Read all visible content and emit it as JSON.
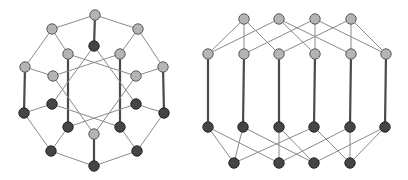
{
  "diagram": {
    "node_radius": 5.2,
    "colors": {
      "light": "#b4b4b4",
      "dark": "#454545",
      "thin_edge": "#8a8a8a",
      "thick_edge": "#4a4a4a"
    },
    "graphs": [
      {
        "name": "left-graph",
        "layout": "circular",
        "nodes": [
          {
            "id": "o_top",
            "x": 95,
            "y": 15,
            "shade": "light"
          },
          {
            "id": "o_ur",
            "x": 138,
            "y": 29,
            "shade": "light"
          },
          {
            "id": "o_r",
            "x": 163,
            "y": 67,
            "shade": "light"
          },
          {
            "id": "o_rd",
            "x": 164,
            "y": 113,
            "shade": "dark"
          },
          {
            "id": "o_lrd",
            "x": 137,
            "y": 151,
            "shade": "dark"
          },
          {
            "id": "o_bot",
            "x": 94,
            "y": 166,
            "shade": "dark"
          },
          {
            "id": "o_lld",
            "x": 51,
            "y": 151,
            "shade": "dark"
          },
          {
            "id": "o_ld",
            "x": 24,
            "y": 113,
            "shade": "dark"
          },
          {
            "id": "o_l",
            "x": 25,
            "y": 67,
            "shade": "light"
          },
          {
            "id": "o_ul",
            "x": 52,
            "y": 29,
            "shade": "light"
          },
          {
            "id": "d0",
            "x": 94,
            "y": 46,
            "shade": "dark"
          },
          {
            "id": "l1",
            "x": 68,
            "y": 54,
            "shade": "light"
          },
          {
            "id": "l2",
            "x": 120,
            "y": 54,
            "shade": "light"
          },
          {
            "id": "l3",
            "x": 53,
            "y": 76,
            "shade": "light"
          },
          {
            "id": "l4",
            "x": 136,
            "y": 76,
            "shade": "light"
          },
          {
            "id": "d1",
            "x": 52,
            "y": 104,
            "shade": "dark"
          },
          {
            "id": "d2",
            "x": 136,
            "y": 104,
            "shade": "dark"
          },
          {
            "id": "d3",
            "x": 68,
            "y": 127,
            "shade": "dark"
          },
          {
            "id": "d4",
            "x": 120,
            "y": 127,
            "shade": "dark"
          },
          {
            "id": "l5",
            "x": 94,
            "y": 134,
            "shade": "light"
          }
        ],
        "edges": [
          [
            "o_top",
            "o_ur",
            "thin"
          ],
          [
            "o_ur",
            "o_r",
            "thin"
          ],
          [
            "o_r",
            "o_rd",
            "thick"
          ],
          [
            "o_rd",
            "o_lrd",
            "thin"
          ],
          [
            "o_lrd",
            "o_bot",
            "thin"
          ],
          [
            "o_bot",
            "o_lld",
            "thin"
          ],
          [
            "o_lld",
            "o_ld",
            "thin"
          ],
          [
            "o_ld",
            "o_l",
            "thick"
          ],
          [
            "o_l",
            "o_ul",
            "thin"
          ],
          [
            "o_ul",
            "o_top",
            "thin"
          ],
          [
            "o_top",
            "d0",
            "thick"
          ],
          [
            "o_bot",
            "l5",
            "thick"
          ],
          [
            "l1",
            "d3",
            "thick"
          ],
          [
            "l2",
            "d4",
            "thick"
          ],
          [
            "o_ul",
            "l1",
            "thin"
          ],
          [
            "o_ur",
            "l2",
            "thin"
          ],
          [
            "o_l",
            "l3",
            "thin"
          ],
          [
            "o_r",
            "l4",
            "thin"
          ],
          [
            "o_ld",
            "d1",
            "thin"
          ],
          [
            "o_rd",
            "d2",
            "thin"
          ],
          [
            "o_lld",
            "d3",
            "thin"
          ],
          [
            "o_lrd",
            "d4",
            "thin"
          ],
          [
            "d0",
            "d1",
            "thin"
          ],
          [
            "d0",
            "d2",
            "thin"
          ],
          [
            "l1",
            "l4",
            "thin"
          ],
          [
            "l2",
            "l3",
            "thin"
          ],
          [
            "d1",
            "d4",
            "thin"
          ],
          [
            "d2",
            "d3",
            "thin"
          ],
          [
            "l5",
            "l3",
            "thin"
          ],
          [
            "l5",
            "l4",
            "thin"
          ]
        ]
      },
      {
        "name": "right-graph",
        "layout": "layered",
        "nodes": [
          {
            "id": "t1",
            "x": 244,
            "y": 19,
            "shade": "light"
          },
          {
            "id": "t2",
            "x": 279,
            "y": 19,
            "shade": "light"
          },
          {
            "id": "t3",
            "x": 315,
            "y": 19,
            "shade": "light"
          },
          {
            "id": "t4",
            "x": 351,
            "y": 19,
            "shade": "light"
          },
          {
            "id": "m1",
            "x": 208,
            "y": 54,
            "shade": "light"
          },
          {
            "id": "m2",
            "x": 244,
            "y": 54,
            "shade": "light"
          },
          {
            "id": "m3",
            "x": 279,
            "y": 54,
            "shade": "light"
          },
          {
            "id": "m4",
            "x": 315,
            "y": 54,
            "shade": "light"
          },
          {
            "id": "m5",
            "x": 351,
            "y": 54,
            "shade": "light"
          },
          {
            "id": "m6",
            "x": 386,
            "y": 54,
            "shade": "light"
          },
          {
            "id": "n1",
            "x": 208,
            "y": 127,
            "shade": "dark"
          },
          {
            "id": "n2",
            "x": 243,
            "y": 127,
            "shade": "dark"
          },
          {
            "id": "n3",
            "x": 279,
            "y": 127,
            "shade": "dark"
          },
          {
            "id": "n4",
            "x": 314,
            "y": 127,
            "shade": "dark"
          },
          {
            "id": "n5",
            "x": 350,
            "y": 127,
            "shade": "dark"
          },
          {
            "id": "n6",
            "x": 385,
            "y": 127,
            "shade": "dark"
          },
          {
            "id": "b1",
            "x": 234,
            "y": 163,
            "shade": "dark"
          },
          {
            "id": "b2",
            "x": 279,
            "y": 163,
            "shade": "dark"
          },
          {
            "id": "b3",
            "x": 314,
            "y": 163,
            "shade": "dark"
          },
          {
            "id": "b4",
            "x": 350,
            "y": 163,
            "shade": "dark"
          }
        ],
        "edges": [
          [
            "t1",
            "m1",
            "thin"
          ],
          [
            "t1",
            "m2",
            "thin"
          ],
          [
            "t1",
            "m3",
            "thin"
          ],
          [
            "t2",
            "m1",
            "thin"
          ],
          [
            "t2",
            "m4",
            "thin"
          ],
          [
            "t2",
            "m5",
            "thin"
          ],
          [
            "t3",
            "m2",
            "thin"
          ],
          [
            "t3",
            "m4",
            "thin"
          ],
          [
            "t3",
            "m6",
            "thin"
          ],
          [
            "t4",
            "m3",
            "thin"
          ],
          [
            "t4",
            "m5",
            "thin"
          ],
          [
            "t4",
            "m6",
            "thin"
          ],
          [
            "m1",
            "n1",
            "thick"
          ],
          [
            "m2",
            "n2",
            "thick"
          ],
          [
            "m3",
            "n3",
            "thick"
          ],
          [
            "m4",
            "n4",
            "thick"
          ],
          [
            "m5",
            "n5",
            "thick"
          ],
          [
            "m6",
            "n6",
            "thick"
          ],
          [
            "b1",
            "n1",
            "thin"
          ],
          [
            "b1",
            "n2",
            "thin"
          ],
          [
            "b1",
            "n4",
            "thin"
          ],
          [
            "b2",
            "n1",
            "thin"
          ],
          [
            "b2",
            "n3",
            "thin"
          ],
          [
            "b2",
            "n5",
            "thin"
          ],
          [
            "b3",
            "n2",
            "thin"
          ],
          [
            "b3",
            "n3",
            "thin"
          ],
          [
            "b3",
            "n6",
            "thin"
          ],
          [
            "b4",
            "n4",
            "thin"
          ],
          [
            "b4",
            "n5",
            "thin"
          ],
          [
            "b4",
            "n6",
            "thin"
          ]
        ]
      }
    ]
  }
}
